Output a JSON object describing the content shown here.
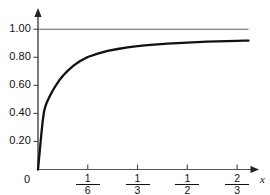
{
  "chart_data": {
    "type": "line",
    "title": "",
    "subtitle": "",
    "xlabel": "x",
    "ylabel": "",
    "xlim": [
      0,
      0.72
    ],
    "ylim": [
      0,
      1.08
    ],
    "grid": false,
    "legend": null,
    "x_tick_labels": [
      "0",
      "1/6",
      "1/3",
      "1/2",
      "2/3"
    ],
    "x_tick_values": [
      0,
      0.1667,
      0.3333,
      0.5,
      0.6667
    ],
    "x_tick_fractions": [
      {
        "numerator": "1",
        "denominator": "6"
      },
      {
        "numerator": "1",
        "denominator": "3"
      },
      {
        "numerator": "1",
        "denominator": "2"
      },
      {
        "numerator": "2",
        "denominator": "3"
      }
    ],
    "y_tick_labels": [
      "0",
      "0.20",
      "0.40",
      "0.60",
      "0.80",
      "1.00"
    ],
    "y_tick_values": [
      0,
      0.2,
      0.4,
      0.6,
      0.8,
      1.0
    ],
    "series": [
      {
        "name": "curve",
        "color": "#111111",
        "line_width": 2.3,
        "x": [
          0.0,
          0.004,
          0.008,
          0.012,
          0.016,
          0.02,
          0.024,
          0.028,
          0.032,
          0.04,
          0.05,
          0.06,
          0.07,
          0.085,
          0.1,
          0.12,
          0.14,
          0.1667,
          0.2,
          0.233,
          0.2667,
          0.3,
          0.3333,
          0.3667,
          0.4,
          0.4333,
          0.4667,
          0.5,
          0.5333,
          0.5667,
          0.6,
          0.6333,
          0.6667,
          0.69,
          0.705
        ],
        "y": [
          0.0,
          0.09,
          0.18,
          0.27,
          0.35,
          0.41,
          0.445,
          0.47,
          0.49,
          0.525,
          0.565,
          0.6,
          0.632,
          0.672,
          0.705,
          0.742,
          0.772,
          0.802,
          0.826,
          0.845,
          0.859,
          0.87,
          0.879,
          0.886,
          0.892,
          0.897,
          0.901,
          0.905,
          0.908,
          0.911,
          0.913,
          0.915,
          0.917,
          0.918,
          0.919
        ]
      },
      {
        "name": "asymptote",
        "color": "#555555",
        "line_width": 0.9,
        "x": [
          0.0,
          0.705
        ],
        "y": [
          1.0,
          1.0
        ]
      }
    ],
    "annotations": [
      {
        "text": "horizontal asymptote at y = 1.00"
      }
    ]
  },
  "axes": {
    "x_axis_label": "x",
    "zero_label": "0",
    "x_arrow": "right-arrow",
    "y_arrow": "up-arrow",
    "axis_color": "#333333"
  }
}
